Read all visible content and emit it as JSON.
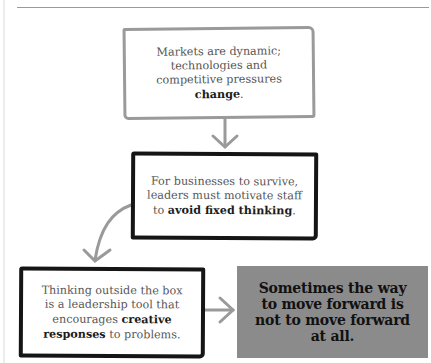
{
  "diagram": {
    "type": "flowchart",
    "nodes": [
      {
        "id": "markets",
        "text_before": "Markets are dynamic; technologies and competitive pressures ",
        "emphasis": "change",
        "text_after": ".",
        "border": "gray"
      },
      {
        "id": "leaders",
        "text_before": "For businesses to survive, leaders must motivate staff to ",
        "emphasis": "avoid fixed thinking",
        "text_after": ".",
        "border": "black"
      },
      {
        "id": "thinking",
        "text_before": "Thinking outside the box is a leadership tool that encourages ",
        "emphasis": "creative responses",
        "text_after": " to problems.",
        "border": "black"
      },
      {
        "id": "conclusion",
        "text": "Sometimes the way to move forward is not to move forward at all.",
        "fill": "#8b8b8b"
      }
    ],
    "edges": [
      {
        "from": "markets",
        "to": "leaders"
      },
      {
        "from": "leaders",
        "to": "thinking"
      },
      {
        "from": "thinking",
        "to": "conclusion"
      }
    ],
    "colors": {
      "arrow": "#9a9a9a",
      "gray_border": "#9a9a9a",
      "black_border": "#151515",
      "conclusion_fill": "#8b8b8b"
    }
  }
}
